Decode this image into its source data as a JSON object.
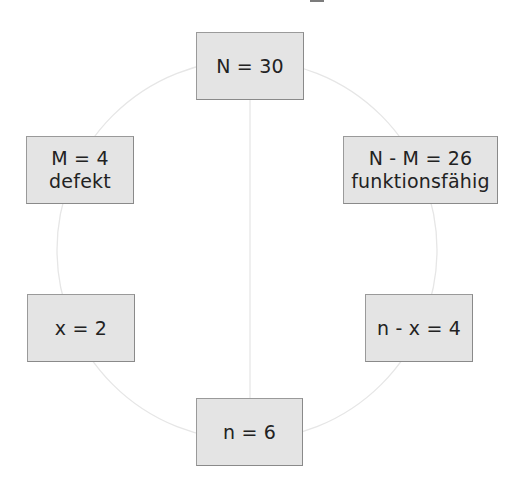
{
  "diagram": {
    "type": "hypergeometric-scheme",
    "colors": {
      "box_fill": "#e4e4e4",
      "box_border": "#9a9a9a",
      "text": "#222222",
      "connector": "#e6e6e6"
    },
    "nodes": {
      "total": {
        "line1": "N = 30"
      },
      "defective": {
        "line1": "M = 4",
        "line2": "defekt"
      },
      "functional": {
        "line1": "N - M = 26",
        "line2": "funktionsfähig"
      },
      "drawn_defective": {
        "line1": "x = 2"
      },
      "drawn_functional": {
        "line1": "n - x = 4"
      },
      "sample": {
        "line1": "n = 6"
      }
    },
    "edges": [
      {
        "from": "total",
        "to": "defective",
        "shape": "arc"
      },
      {
        "from": "total",
        "to": "functional",
        "shape": "arc"
      },
      {
        "from": "defective",
        "to": "drawn_defective",
        "shape": "arc"
      },
      {
        "from": "functional",
        "to": "drawn_functional",
        "shape": "arc"
      },
      {
        "from": "drawn_defective",
        "to": "sample",
        "shape": "arc"
      },
      {
        "from": "drawn_functional",
        "to": "sample",
        "shape": "arc"
      },
      {
        "from": "total",
        "to": "sample",
        "shape": "line"
      }
    ]
  }
}
